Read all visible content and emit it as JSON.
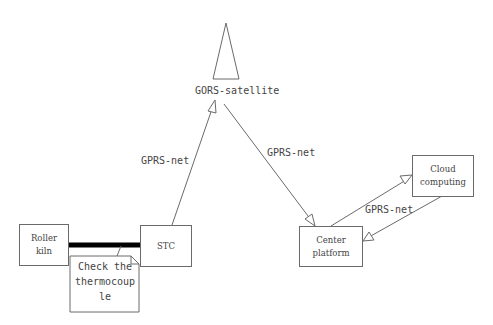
{
  "diagram": {
    "satellite": {
      "label": "GORS-satellite",
      "icon": "satellite-antenna-triangle"
    },
    "nodes": {
      "roller_kiln": {
        "line1": "Roller",
        "line2": "kiln"
      },
      "stc": {
        "label": "STC"
      },
      "center_platform": {
        "line1": "Center",
        "line2": "platform"
      },
      "cloud_computing": {
        "line1": "Cloud",
        "line2": "computing"
      }
    },
    "note": {
      "line1": "Check the",
      "line2": "thermocoup",
      "line3": "le"
    },
    "edges": {
      "stc_to_satellite": {
        "label": "GPRS-net"
      },
      "satellite_to_center": {
        "label": "GPRS-net"
      },
      "center_cloud": {
        "label": "GPRS-net"
      }
    },
    "colors": {
      "stroke": "#6a6a6a",
      "thick_link": "#000000",
      "text": "#444444",
      "background": "#ffffff"
    }
  }
}
